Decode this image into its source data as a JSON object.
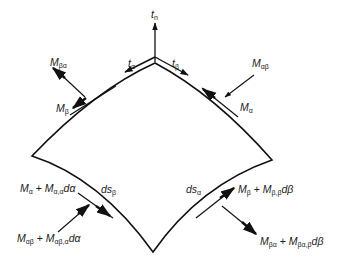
{
  "diagram": {
    "colors": {
      "line": "#111111",
      "background": "#ffffff"
    },
    "vectors": {
      "tn": {
        "base": "t",
        "sub": "n"
      },
      "ta": {
        "base": "t",
        "sub": "α"
      },
      "tb": {
        "base": "t",
        "sub": "β"
      }
    },
    "labels": {
      "M_ba": {
        "base": "M",
        "sub": "βα"
      },
      "M_b": {
        "base": "M",
        "sub": "β"
      },
      "M_ab": {
        "base": "M",
        "sub": "αβ"
      },
      "M_a": {
        "base": "M",
        "sub": "α"
      },
      "ds_b": {
        "base": "ds",
        "sub": "β"
      },
      "ds_a": {
        "base": "ds",
        "sub": "α"
      },
      "Ma_plus": {
        "b1": "M",
        "s1": "α",
        "plus": " + ",
        "b2": "M",
        "s2": "α,α",
        "tail": "dα"
      },
      "Mab_plus": {
        "b1": "M",
        "s1": "αβ",
        "plus": " + ",
        "b2": "M",
        "s2": "αβ,α",
        "tail": "dα"
      },
      "Mb_plus": {
        "b1": "M",
        "s1": "β",
        "plus": " + ",
        "b2": "M",
        "s2": "β,β",
        "tail": "dβ"
      },
      "Mba_plus": {
        "b1": "M",
        "s1": "βα",
        "plus": " + ",
        "b2": "M",
        "s2": "βα,β",
        "tail": "dβ"
      }
    }
  }
}
